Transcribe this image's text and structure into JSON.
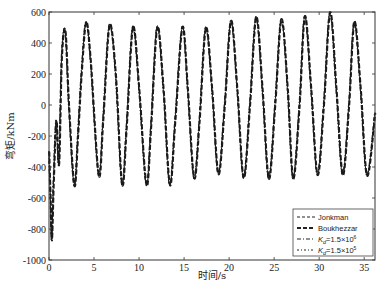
{
  "chart_data": {
    "type": "line",
    "title": "",
    "xlabel": "时间/s",
    "ylabel": "弯矩/kNm",
    "xlim": [
      0,
      36.2
    ],
    "ylim": [
      -1000,
      600
    ],
    "xticks": [
      0,
      5,
      10,
      15,
      20,
      25,
      30,
      35
    ],
    "xtick_labels": [
      "0",
      "5",
      "10",
      "15",
      "20",
      "25",
      "30",
      "35"
    ],
    "yticks": [
      -1000,
      -800,
      -600,
      -400,
      -200,
      0,
      200,
      400,
      600
    ],
    "ytick_labels": [
      "-1000",
      "-800",
      "-600",
      "-400",
      "-200",
      "0",
      "200",
      "400",
      "600"
    ],
    "grid": false,
    "legend_position": "lower right",
    "series": [
      {
        "name": "Jonkman",
        "style": "dashed-thin",
        "points": [
          [
            0,
            -300
          ],
          [
            0.15,
            -600
          ],
          [
            0.3,
            -870
          ],
          [
            0.5,
            -500
          ],
          [
            0.8,
            -100
          ],
          [
            1.1,
            -380
          ],
          [
            1.4,
            300
          ],
          [
            1.8,
            480
          ],
          [
            2.2,
            0
          ],
          [
            2.8,
            -520
          ],
          [
            3.2,
            -200
          ],
          [
            3.6,
            200
          ],
          [
            4.1,
            535
          ],
          [
            4.6,
            300
          ],
          [
            5.5,
            -450
          ],
          [
            6.0,
            -100
          ],
          [
            6.7,
            515
          ],
          [
            7.4,
            200
          ],
          [
            8.1,
            -510
          ],
          [
            8.6,
            -150
          ],
          [
            9.3,
            505
          ],
          [
            10.0,
            100
          ],
          [
            10.8,
            -515
          ],
          [
            11.3,
            -150
          ],
          [
            12.0,
            505
          ],
          [
            12.7,
            100
          ],
          [
            13.4,
            -515
          ],
          [
            14.0,
            -100
          ],
          [
            14.8,
            505
          ],
          [
            15.4,
            100
          ],
          [
            16.1,
            -470
          ],
          [
            16.7,
            -100
          ],
          [
            17.4,
            500
          ],
          [
            18.1,
            100
          ],
          [
            18.8,
            -445
          ],
          [
            19.5,
            0
          ],
          [
            20.2,
            545
          ],
          [
            20.9,
            100
          ],
          [
            21.6,
            -470
          ],
          [
            22.3,
            0
          ],
          [
            23.0,
            570
          ],
          [
            23.7,
            100
          ],
          [
            24.4,
            -475
          ],
          [
            25.1,
            0
          ],
          [
            25.8,
            555
          ],
          [
            26.5,
            100
          ],
          [
            27.1,
            -475
          ],
          [
            27.8,
            0
          ],
          [
            28.4,
            575
          ],
          [
            29.1,
            100
          ],
          [
            29.8,
            -450
          ],
          [
            30.5,
            0
          ],
          [
            31.2,
            600
          ],
          [
            31.9,
            100
          ],
          [
            32.6,
            -450
          ],
          [
            33.3,
            0
          ],
          [
            33.9,
            540
          ],
          [
            34.6,
            100
          ],
          [
            35.3,
            -455
          ],
          [
            36.2,
            -50
          ]
        ]
      },
      {
        "name": "Boukhezzar",
        "style": "dashed-thick",
        "points": "same-as-Jonkman"
      },
      {
        "name": "K_d=1.5×10^6",
        "style": "dash-dot",
        "points": "same-as-Jonkman"
      },
      {
        "name": "K_d=1.5×10^5",
        "style": "dash-dot-thin",
        "points": "same-as-Jonkman"
      }
    ]
  },
  "legend": {
    "entries": [
      {
        "label": "Jonkman",
        "sub": "",
        "sup": ""
      },
      {
        "label": "Boukhezzar",
        "sub": "",
        "sup": ""
      },
      {
        "label": "K",
        "sub": "d",
        "rest": "=1.5×10",
        "sup": "6"
      },
      {
        "label": "K",
        "sub": "d",
        "rest": "=1.5×10",
        "sup": "5"
      }
    ]
  },
  "colors": {
    "line": "#1a1a1a",
    "axis": "#333333",
    "background": "#ffffff"
  }
}
